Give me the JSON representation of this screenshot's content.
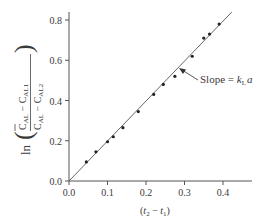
{
  "chart_data": {
    "type": "scatter",
    "title": "",
    "xlabel": "(t2 - t1)",
    "ylabel": "ln((C̄AL - CAL1)/(C̄AL - CAL2))",
    "xlim": [
      0.0,
      0.45
    ],
    "ylim": [
      0.0,
      0.85
    ],
    "x_ticks": [
      0.0,
      0.1,
      0.2,
      0.3,
      0.4
    ],
    "x_tick_labels": [
      "0.0",
      "0.1",
      "0.2",
      "0.3",
      "0.4"
    ],
    "y_ticks": [
      0.0,
      0.2,
      0.4,
      0.6,
      0.8
    ],
    "y_tick_labels": [
      "0.0",
      "0.2",
      "0.4",
      "0.6",
      "0.8"
    ],
    "grid": false,
    "legend": null,
    "series": [
      {
        "name": "data points",
        "type": "scatter",
        "x": [
          0.045,
          0.07,
          0.1,
          0.115,
          0.14,
          0.18,
          0.22,
          0.245,
          0.275,
          0.32,
          0.35,
          0.365,
          0.39
        ],
        "y": [
          0.095,
          0.145,
          0.195,
          0.22,
          0.265,
          0.345,
          0.43,
          0.48,
          0.52,
          0.62,
          0.71,
          0.73,
          0.78
        ]
      },
      {
        "name": "linear fit",
        "type": "line",
        "x": [
          0.0,
          0.423
        ],
        "y": [
          0.0,
          0.84
        ]
      }
    ],
    "annotations": [
      {
        "text": "Slope = kLa",
        "points_to": [
          0.285,
          0.565
        ]
      }
    ]
  },
  "labels": {
    "x_axis": {
      "open": "(",
      "t2": "t",
      "sub2": "2",
      "minus": " − ",
      "t1": "t",
      "sub1": "1",
      "close": ")"
    },
    "y_axis": {
      "ln": "ln",
      "c": "C",
      "sub_al": "AL",
      "sub_al1": "AL1",
      "sub_al2": "AL2",
      "minus": " − "
    },
    "annotation": {
      "prefix": "Slope = ",
      "k": "k",
      "sub": "L",
      "a": "a"
    },
    "x_ticks": [
      "0.0",
      "0.1",
      "0.2",
      "0.3",
      "0.4"
    ],
    "y_ticks": [
      "0.0",
      "0.2",
      "0.4",
      "0.6",
      "0.8"
    ]
  }
}
